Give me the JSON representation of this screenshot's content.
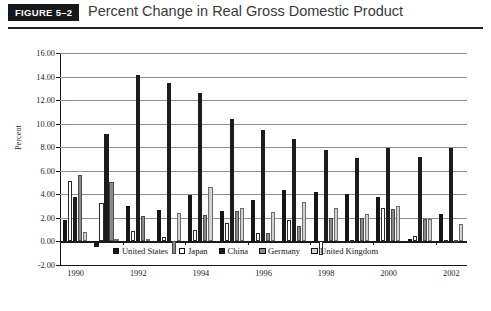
{
  "header": {
    "figure_tag": "FIGURE 5–2",
    "title": "Percent Change in Real Gross Domestic Product"
  },
  "chart_data": {
    "type": "bar",
    "title": "Percent Change in Real Gross Domestic Product",
    "xlabel": "",
    "ylabel": "Percent",
    "ylim": [
      -2.0,
      16.0
    ],
    "ytick_step": 2.0,
    "ytick_labels": [
      "16.00",
      "14.00",
      "12.00",
      "10.00",
      "8.00",
      "6.00",
      "4.00",
      "2.00",
      "0.00",
      "-2.00"
    ],
    "ytick_values": [
      16.0,
      14.0,
      12.0,
      10.0,
      8.0,
      6.0,
      4.0,
      2.0,
      0.0,
      -2.0
    ],
    "grid": true,
    "legend_position": "bottom",
    "categories": [
      1990,
      1991,
      1992,
      1993,
      1994,
      1995,
      1996,
      1997,
      1998,
      1999,
      2000,
      2001,
      2002
    ],
    "xtick_labels": [
      "1990",
      "1992",
      "1994",
      "1996",
      "1998",
      "2000",
      "2002"
    ],
    "xtick_values": [
      1990,
      1992,
      1994,
      1996,
      1998,
      2000,
      2002
    ],
    "series": [
      {
        "name": "United States",
        "color": "#16161a",
        "style": "solid-black",
        "values": [
          1.85,
          -0.5,
          3.05,
          2.65,
          3.95,
          2.6,
          3.5,
          4.35,
          4.2,
          4.0,
          3.75,
          0.25,
          2.3
        ]
      },
      {
        "name": "Japan",
        "color": "#ffffff",
        "style": "white-outline",
        "values": [
          5.15,
          3.25,
          0.9,
          0.4,
          1.0,
          1.6,
          0.7,
          1.85,
          -1.15,
          0.15,
          2.8,
          0.5,
          0.1
        ]
      },
      {
        "name": "China",
        "color": "#1c1c20",
        "style": "solid-black",
        "values": [
          3.8,
          9.15,
          14.1,
          13.45,
          12.6,
          10.4,
          9.5,
          8.7,
          7.75,
          7.05,
          7.9,
          7.2,
          7.9
        ]
      },
      {
        "name": "Germany",
        "color": "#8a8a8a",
        "style": "gray-hatch",
        "values": [
          5.65,
          5.05,
          2.2,
          -1.1,
          2.25,
          2.6,
          0.75,
          1.3,
          1.95,
          1.95,
          2.75,
          1.9,
          0.15
        ]
      },
      {
        "name": "United Kingdom",
        "color": "#d2d2d2",
        "style": "light-gray",
        "values": [
          0.8,
          0.2,
          0.2,
          2.45,
          4.65,
          2.85,
          2.5,
          3.35,
          2.8,
          2.3,
          3.0,
          1.9,
          1.5
        ]
      }
    ]
  },
  "legend": {
    "items": [
      {
        "label": "United States"
      },
      {
        "label": "Japan"
      },
      {
        "label": "China"
      },
      {
        "label": "Germany"
      },
      {
        "label": "United Kingdom"
      }
    ]
  }
}
